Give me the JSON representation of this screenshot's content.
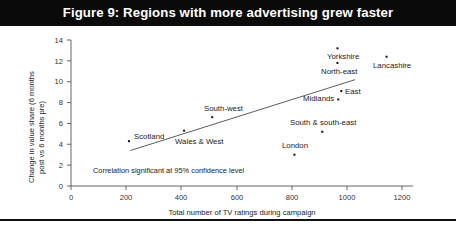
{
  "title": "Figure 9: Regions with more advertising grew faster",
  "chart_data": {
    "type": "scatter",
    "title": "Figure 9: Regions with more advertising grew faster",
    "xlabel": "Total number of TV ratings during campaign",
    "ylabel": "Change in value share (6 months post vs 6 months pre)",
    "ylabel_line1": "Change in value share (6 months",
    "ylabel_line2": "post vs 6 months pre)",
    "xlim": [
      0,
      1250
    ],
    "ylim": [
      0,
      14
    ],
    "xticks": [
      0,
      200,
      400,
      600,
      800,
      1000,
      1200
    ],
    "yticks": [
      0,
      2,
      4,
      6,
      8,
      10,
      12,
      14
    ],
    "xtick_labels": [
      "0",
      "200",
      "400",
      "600",
      "800",
      "1000",
      "1200"
    ],
    "ytick_labels": [
      "0",
      "2",
      "4",
      "6",
      "8",
      "10",
      "12",
      "14"
    ],
    "grid": false,
    "legend": "none",
    "annotation": "Correlation significant at 95% confidence level",
    "trendline": {
      "x0": 215,
      "y0": 3.4,
      "x1": 1030,
      "y1": 10.2
    },
    "points": [
      {
        "label": "Scotland",
        "x": 210,
        "y": 4.3,
        "label_pos": "left"
      },
      {
        "label": "Wales & West",
        "x": 410,
        "y": 5.3,
        "label_pos": "below-right"
      },
      {
        "label": "South-west",
        "x": 512,
        "y": 6.6,
        "label_pos": "above"
      },
      {
        "label": "London",
        "x": 810,
        "y": 3.0,
        "label_pos": "above"
      },
      {
        "label": "South & south-east",
        "x": 911,
        "y": 5.2,
        "label_pos": "above"
      },
      {
        "label": "Midlands",
        "x": 969,
        "y": 8.3,
        "label_pos": "left"
      },
      {
        "label": "East",
        "x": 980,
        "y": 9.1,
        "label_pos": "right"
      },
      {
        "label": "North-east",
        "x": 966,
        "y": 11.8,
        "label_pos": "below"
      },
      {
        "label": "Yorkshire",
        "x": 966,
        "y": 13.2,
        "label_pos": "below"
      },
      {
        "label": "Lancashire",
        "x": 1144,
        "y": 12.4,
        "label_pos": "below"
      }
    ]
  },
  "colors": {
    "title_bar": "#0a0a0a",
    "title_text": "#ffffff",
    "marker": "#111111",
    "axis": "#555555",
    "trend": "#4a4a4a",
    "background": "#ffffff"
  }
}
